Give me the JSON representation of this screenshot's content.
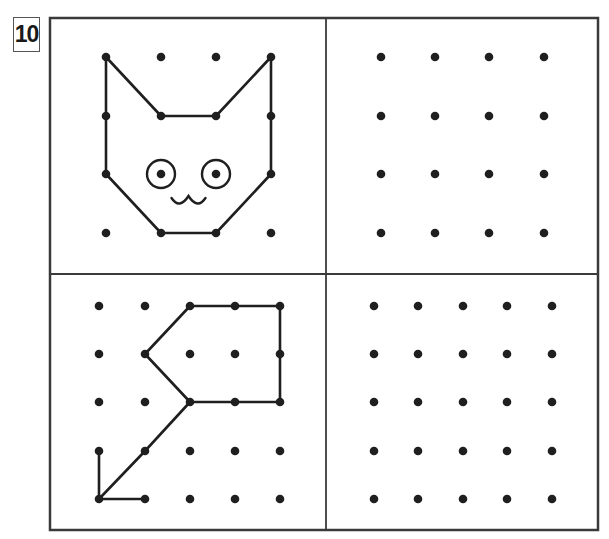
{
  "exercise": {
    "number": "10",
    "panels": [
      {
        "id": "top-left",
        "role": "example",
        "grid": {
          "cols": 4,
          "rows": 4,
          "x": [
            106,
            161,
            216,
            271
          ],
          "y": [
            57,
            116,
            174,
            233
          ]
        },
        "figure": "cat-face",
        "outline": [
          [
            106,
            57
          ],
          [
            161,
            116
          ],
          [
            216,
            116
          ],
          [
            271,
            57
          ],
          [
            271,
            116
          ],
          [
            271,
            174
          ],
          [
            216,
            233
          ],
          [
            161,
            233
          ],
          [
            106,
            174
          ],
          [
            106,
            116
          ],
          [
            106,
            57
          ]
        ],
        "eyes": [
          {
            "cx": 161,
            "cy": 174,
            "r": 14
          },
          {
            "cx": 216,
            "cy": 174,
            "r": 14
          }
        ]
      },
      {
        "id": "top-right",
        "role": "blank-practice-grid",
        "grid": {
          "cols": 4,
          "rows": 4,
          "x": [
            381,
            435,
            489,
            544
          ],
          "y": [
            57,
            116,
            174,
            233
          ]
        }
      },
      {
        "id": "bottom-left",
        "role": "example",
        "grid": {
          "cols": 5,
          "rows": 5,
          "x": [
            99,
            145,
            190,
            235,
            280
          ],
          "y": [
            306,
            354,
            402,
            451,
            499
          ]
        },
        "figure": "flag-shape",
        "outline": [
          [
            99,
            451
          ],
          [
            99,
            499
          ],
          [
            145,
            499
          ]
        ],
        "outline2": [
          [
            99,
            499
          ],
          [
            145,
            451
          ],
          [
            190,
            402
          ],
          [
            145,
            354
          ],
          [
            190,
            306
          ],
          [
            235,
            306
          ],
          [
            280,
            306
          ],
          [
            280,
            354
          ],
          [
            280,
            402
          ],
          [
            235,
            402
          ],
          [
            190,
            402
          ]
        ]
      },
      {
        "id": "bottom-right",
        "role": "blank-practice-grid",
        "grid": {
          "cols": 5,
          "rows": 5,
          "x": [
            374,
            418,
            463,
            507,
            552
          ],
          "y": [
            306,
            354,
            402,
            451,
            499
          ]
        }
      }
    ]
  },
  "colors": {
    "ink": "#1f1f1f",
    "frame": "#3a3a3a",
    "background": "#ffffff"
  }
}
